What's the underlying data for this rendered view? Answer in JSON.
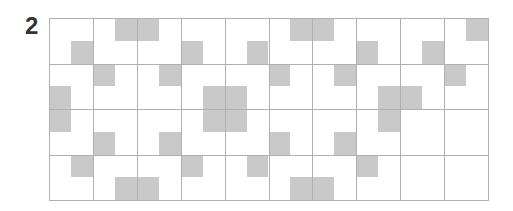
{
  "puzzle": {
    "number": "2",
    "grid": {
      "major_cols": 10,
      "major_rows": 4,
      "sub_cols": 20,
      "sub_rows": 8,
      "fill_color": "#c9c9c9",
      "line_color": "#b0b0b0",
      "shaded": [
        [
          0,
          3
        ],
        [
          0,
          4
        ],
        [
          0,
          11
        ],
        [
          0,
          12
        ],
        [
          0,
          19
        ],
        [
          1,
          1
        ],
        [
          1,
          6
        ],
        [
          1,
          9
        ],
        [
          1,
          14
        ],
        [
          1,
          17
        ],
        [
          2,
          2
        ],
        [
          2,
          5
        ],
        [
          2,
          10
        ],
        [
          2,
          13
        ],
        [
          2,
          18
        ],
        [
          3,
          0
        ],
        [
          3,
          7
        ],
        [
          3,
          8
        ],
        [
          3,
          15
        ],
        [
          3,
          16
        ],
        [
          4,
          0
        ],
        [
          4,
          7
        ],
        [
          4,
          8
        ],
        [
          4,
          15
        ],
        [
          5,
          2
        ],
        [
          5,
          5
        ],
        [
          5,
          10
        ],
        [
          5,
          13
        ],
        [
          6,
          1
        ],
        [
          6,
          6
        ],
        [
          6,
          9
        ],
        [
          6,
          14
        ],
        [
          7,
          3
        ],
        [
          7,
          4
        ],
        [
          7,
          11
        ],
        [
          7,
          12
        ]
      ]
    }
  }
}
